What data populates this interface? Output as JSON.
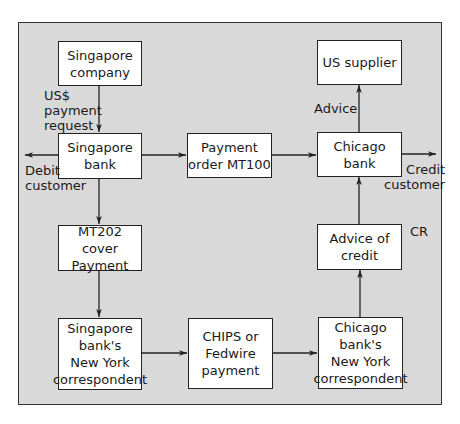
{
  "diagram": {
    "nodes": {
      "singapore_company": "Singapore\ncompany",
      "singapore_bank": "Singapore\nbank",
      "payment_order": "Payment\norder MT100",
      "chicago_bank": "Chicago\nbank",
      "us_supplier": "US supplier",
      "mt202_cover": "MT202 cover\nPayment",
      "advice_of_credit": "Advice of\ncredit",
      "sg_ny_correspondent": "Singapore\nbank's\nNew York\ncorrespondent",
      "chips_fedwire": "CHIPS or\nFedwire\npayment",
      "chi_ny_correspondent": "Chicago\nbank's\nNew York\ncorrespondent"
    },
    "labels": {
      "us_payment_request": "US$\npayment\nrequest",
      "debit_customer": "Debit\ncustomer",
      "credit_customer": "Credit\ncustomer",
      "advice": "Advice",
      "cr": "CR"
    },
    "edges": [
      {
        "from": "singapore_company",
        "to": "singapore_bank",
        "label": "US$ payment request"
      },
      {
        "from": "singapore_bank",
        "to": "debit_customer"
      },
      {
        "from": "singapore_bank",
        "to": "payment_order"
      },
      {
        "from": "payment_order",
        "to": "chicago_bank"
      },
      {
        "from": "chicago_bank",
        "to": "credit_customer"
      },
      {
        "from": "chicago_bank",
        "to": "us_supplier",
        "label": "Advice"
      },
      {
        "from": "singapore_bank",
        "to": "mt202_cover"
      },
      {
        "from": "mt202_cover",
        "to": "sg_ny_correspondent"
      },
      {
        "from": "sg_ny_correspondent",
        "to": "chips_fedwire"
      },
      {
        "from": "chips_fedwire",
        "to": "chi_ny_correspondent"
      },
      {
        "from": "chi_ny_correspondent",
        "to": "advice_of_credit"
      },
      {
        "from": "advice_of_credit",
        "to": "chicago_bank"
      }
    ]
  }
}
